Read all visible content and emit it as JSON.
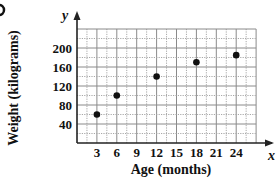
{
  "chart_data": {
    "type": "scatter",
    "title": "",
    "figure_marker": "(partially cropped panel label at top-left)",
    "xlabel": "Age (months)",
    "ylabel": "Weight (kilograms)",
    "x_axis_letter": "x",
    "y_axis_letter": "y",
    "x_ticks": [
      3,
      6,
      9,
      12,
      15,
      18,
      21,
      24
    ],
    "y_ticks": [
      40,
      80,
      120,
      160,
      200
    ],
    "xlim": [
      0,
      27
    ],
    "ylim": [
      0,
      240
    ],
    "grid": true,
    "grid_minor_x": 1.5,
    "grid_minor_y": 20,
    "legend": null,
    "points": [
      {
        "x": 3,
        "y": 60
      },
      {
        "x": 6,
        "y": 100
      },
      {
        "x": 12,
        "y": 140
      },
      {
        "x": 18,
        "y": 170
      },
      {
        "x": 24,
        "y": 185
      }
    ],
    "colors": {
      "points": "#111111",
      "grid": "#9a9a9a",
      "axis": "#222222"
    }
  }
}
